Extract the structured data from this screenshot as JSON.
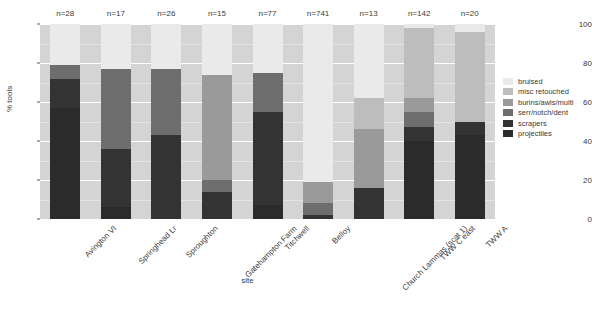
{
  "chart_data": {
    "type": "bar",
    "stacked": true,
    "title": "",
    "xlabel": "site",
    "ylabel": "% tools",
    "ylim": [
      0,
      100
    ],
    "yticks": [
      0,
      20,
      40,
      60,
      80,
      100
    ],
    "grid": true,
    "legend_position": "right",
    "categories": [
      "Avington VI",
      "Springhead Lr",
      "Sproughton",
      "Gatehampton Farm",
      "Titchwell",
      "Belloy",
      "Church Lammas (scat 1)",
      "TWW C east",
      "TWW A"
    ],
    "sample_sizes": [
      "n=28",
      "n=17",
      "n=26",
      "n=15",
      "n=77",
      "n=741",
      "n=13",
      "n=142",
      "n=20"
    ],
    "series": [
      {
        "name": "projectiles",
        "color": "#2b2b2b",
        "values": [
          57,
          6,
          0,
          0,
          7,
          0,
          0,
          40,
          43
        ]
      },
      {
        "name": "scrapers",
        "color": "#333333",
        "values": [
          15,
          30,
          43,
          14,
          48,
          2,
          16,
          7,
          7
        ]
      },
      {
        "name": "serr/notch/dent",
        "color": "#6e6e6e",
        "values": [
          7,
          41,
          34,
          6,
          20,
          6,
          0,
          8,
          0
        ]
      },
      {
        "name": "burins/awls/multi",
        "color": "#9a9a9a",
        "values": [
          0,
          0,
          0,
          54,
          0,
          11,
          30,
          7,
          0
        ]
      },
      {
        "name": "misc retouched",
        "color": "#bdbdbd",
        "values": [
          0,
          0,
          0,
          0,
          0,
          0,
          16,
          36,
          46
        ]
      },
      {
        "name": "bruised",
        "color": "#eaeaea",
        "values": [
          21,
          23,
          23,
          26,
          25,
          81,
          38,
          2,
          4
        ]
      }
    ],
    "legend_entries": [
      {
        "label": "bruised",
        "color": "#eaeaea"
      },
      {
        "label": "misc retouched",
        "color": "#bdbdbd"
      },
      {
        "label": "burins/awls/multi",
        "color": "#9a9a9a"
      },
      {
        "label": "serr/notch/dent",
        "color": "#6e6e6e"
      },
      {
        "label": "scrapers",
        "color": "#333333"
      },
      {
        "label": "projectiles",
        "color": "#2b2b2b"
      }
    ],
    "plot_background": "#d4d4d4",
    "gridline_color": "#ffffff"
  }
}
